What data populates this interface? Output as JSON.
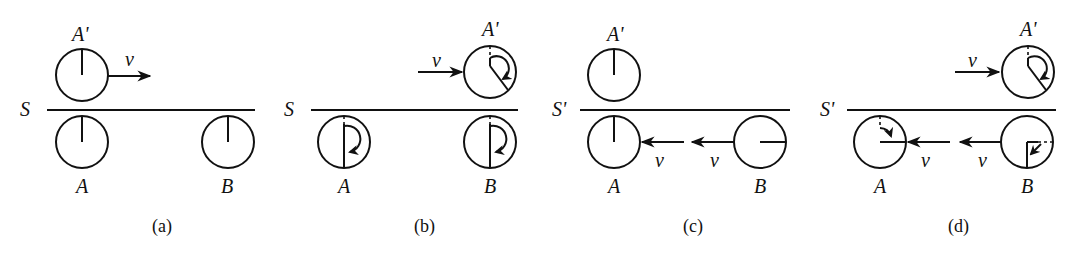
{
  "figure": {
    "panels": [
      {
        "id": "a",
        "caption": "(a)",
        "frame_label": "S",
        "velocity_label": "v",
        "clocks": [
          {
            "label": "A'",
            "hand": "12 o'clock",
            "moving": "right"
          },
          {
            "label": "A",
            "hand": "12 o'clock"
          },
          {
            "label": "B",
            "hand": "12 o'clock"
          }
        ]
      },
      {
        "id": "b",
        "caption": "(b)",
        "frame_label": "S",
        "velocity_label": "v",
        "clocks": [
          {
            "label": "A'",
            "hand": "about 4:30 position",
            "moving": "right"
          },
          {
            "label": "A",
            "hand": "6 o'clock"
          },
          {
            "label": "B",
            "hand": "6 o'clock"
          }
        ]
      },
      {
        "id": "c",
        "caption": "(c)",
        "frame_label": "S'",
        "velocity_labels": [
          "v",
          "v"
        ],
        "clocks": [
          {
            "label": "A'",
            "hand": "12 o'clock"
          },
          {
            "label": "A",
            "hand": "12 o'clock",
            "moving": "left"
          },
          {
            "label": "B",
            "hand": "3 o'clock",
            "moving": "left"
          }
        ]
      },
      {
        "id": "d",
        "caption": "(d)",
        "frame_label": "S'",
        "velocity_labels": [
          "v",
          "v",
          "v"
        ],
        "clocks": [
          {
            "label": "A'",
            "hand": "about 4:30 position"
          },
          {
            "label": "A",
            "hand": "3 o'clock",
            "moving": "left"
          },
          {
            "label": "B",
            "hand": "6 o'clock",
            "moving": "left"
          }
        ]
      }
    ]
  }
}
